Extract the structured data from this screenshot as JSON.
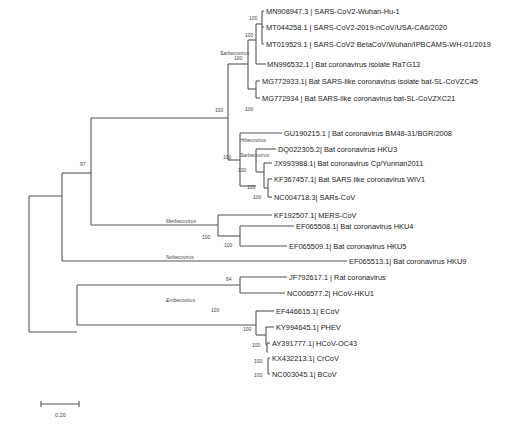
{
  "tree": {
    "leaves": [
      "MN908947.3 | SARS-CoV2-Wuhan-Hu-1",
      "MT044258.1 | SARS-CoV2-2019-nCoV/USA-CA6/2020",
      "MT019529.1 | SARS-CoV2 BetaCoV/Wuhan/IPBCAMS-WH-01/2019",
      "MN996532.1 | Bat coronavirus isolate RaTG13",
      "MG772933.1| Bat SARS-like coronavirus isolate bat-SL-CoVZC45",
      "MG772934 | Bat SARS-like coronavirus bat-SL-CoVZXC21",
      "GU190215.1 | Bat coronavirus BM48-31/BGR/2008",
      "DQ022305.2| Bat coronavirus HKU3",
      "JX993988.1| Bat coronavirus Cp/Yunnan2011",
      "KF367457.1| Bat SARS like coronavirus WIV1",
      "NC004718.3| SARs-CoV",
      "KF192507.1| MERS-CoV",
      "EF065508.1| Bat coronavirus HKU4",
      "EF065509.1| Bat coronavirus HKU5",
      "EF065513.1| Bat coronavirus HKU9",
      "JF792617.1 | Rat coronavirus",
      "NC006577.2| HCoV-HKU1",
      "EF446615.1| ECoV",
      "KY994645.1| PHEV",
      "AY391777.1| HCoV-OC43",
      "KX432213.1| CrCoV",
      "NC003045.1| BCoV"
    ],
    "bootstrap": {
      "sars2_inner": "100",
      "sars2_group": "100",
      "sarbeco_ratg13": "100",
      "sarbeco_main": "100",
      "zc45_zxc21": "100",
      "sarbeco_hibeco": "100",
      "sars1_group": "100",
      "wiv1_group": "100",
      "wiv1_sars": "100",
      "beta_top": "97",
      "merbeco": "100",
      "hku4_hku5": "100",
      "rat_hku1": "64",
      "embeco": "100",
      "embeco_inner": "100",
      "oc43_group": "100",
      "crcov_bcov": "100",
      "crcov_bcov_inner": "100"
    },
    "clades": {
      "sarbeco1": "Sarbecovirus",
      "hibeco": "Hibecovirus",
      "sarbeco2": "Sarbecovirus",
      "merbeco": "Merbecovirus",
      "nobeco": "Nobecovirus",
      "embeco": "Embecovirus"
    }
  },
  "scale_bar": {
    "label": "0.20"
  }
}
